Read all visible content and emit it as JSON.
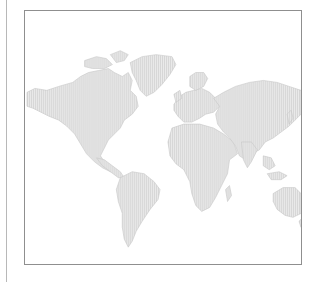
{
  "figure": {
    "type": "world-map",
    "style": "vertical-hatch",
    "colors": {
      "land_fill": "#e4e4e4",
      "land_hatch": "#d2d2d2",
      "land_outline": "#c8c8c8",
      "ocean": "#ffffff",
      "frame_border": "#8f8f8f",
      "side_rule": "#b8b8b8"
    },
    "regions": [
      {
        "id": "north-america",
        "label": "North America"
      },
      {
        "id": "greenland",
        "label": "Greenland"
      },
      {
        "id": "south-america",
        "label": "South America"
      },
      {
        "id": "europe",
        "label": "Europe"
      },
      {
        "id": "africa",
        "label": "Africa"
      },
      {
        "id": "asia",
        "label": "Asia"
      },
      {
        "id": "australia",
        "label": "Australia"
      }
    ]
  }
}
